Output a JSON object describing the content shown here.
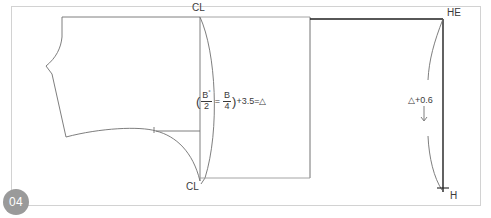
{
  "page": {
    "figure_number": "04",
    "background_color": "#ffffff",
    "frame_border_color": "#d2d2d2",
    "line_color": "#6f6f6f",
    "heavy_line_color": "#1f1f1f",
    "text_color": "#3b3b3b",
    "badge_color": "#9a9a9a"
  },
  "labels": {
    "cl_top": "CL",
    "cl_bottom": "CL",
    "he": "HE",
    "h": "H",
    "delta_plus": "△+0.6"
  },
  "formula": {
    "open_paren": "(",
    "numerator_1": "B",
    "numerator_1_prime": "°",
    "denominator_1": "2",
    "equals_inner": "=",
    "numerator_2": "B",
    "denominator_2": "4",
    "close_paren": ")",
    "plus_value": "+3.5=",
    "result": "△",
    "full_text": "(B°/2 = B/4)+3.5=△"
  },
  "icons": {
    "down_arrow": "↓"
  }
}
